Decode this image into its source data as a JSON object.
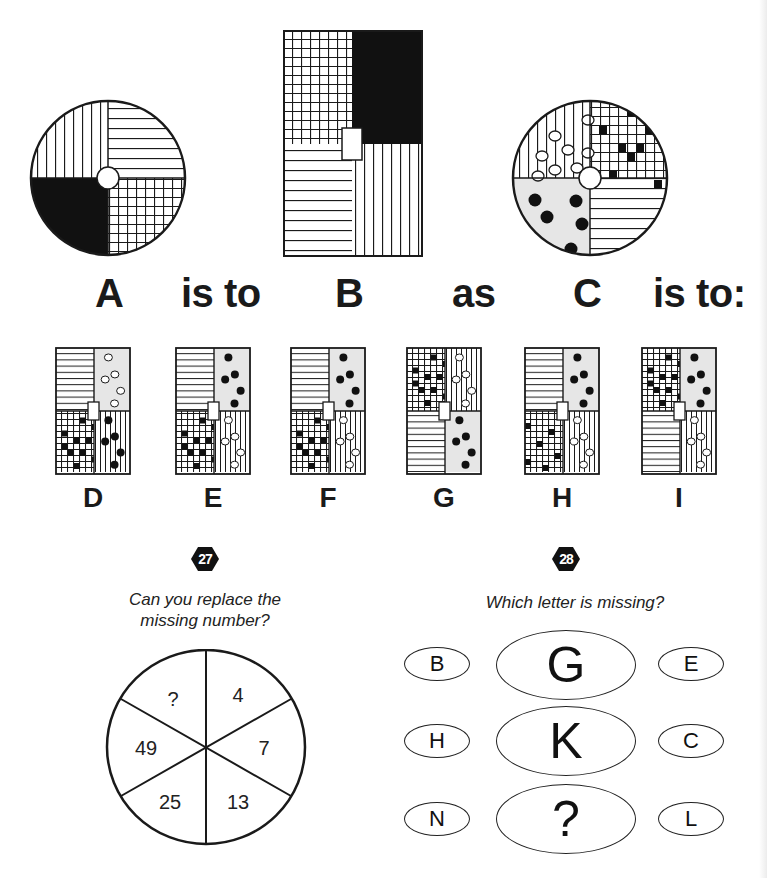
{
  "puzzle26": {
    "figures": {
      "A": {
        "label": "A",
        "shape": "circle",
        "quadrants": {
          "top_left": "vertical-lines",
          "top_right": "horizontal-lines",
          "bottom_left": "solid-black",
          "bottom_right": "grid"
        },
        "center": "white-circle"
      },
      "B": {
        "label": "B",
        "shape": "rectangle",
        "quadrants": {
          "top_left": "grid",
          "top_right": "solid-black",
          "bottom_left": "horizontal-lines",
          "bottom_right": "vertical-lines"
        },
        "center": "white-rectangle"
      },
      "C": {
        "label": "C",
        "shape": "circle",
        "quadrants": {
          "top_left": "vertical-lines-with-white-dots",
          "top_right": "grid-with-black-squares",
          "bottom_left": "grey-with-black-dots",
          "bottom_right": "horizontal-lines"
        },
        "center": "white-circle"
      }
    },
    "sentence": {
      "word1": "is to",
      "word2": "as",
      "word3": "is to:"
    },
    "options": [
      {
        "label": "D",
        "tl": "horizontal-lines",
        "tr": "grey-with-white-dots",
        "bl": "grid-with-black-squares",
        "br": "vertical-lines-with-black-dots"
      },
      {
        "label": "E",
        "tl": "horizontal-lines",
        "tr": "grey-with-black-dots",
        "bl": "grid-with-black-squares",
        "br": "vertical-lines-with-white-dots"
      },
      {
        "label": "F",
        "tl": "horizontal-lines",
        "tr": "grey-with-black-dots",
        "bl": "grid-with-black-squares",
        "br": "vertical-lines-with-white-dots"
      },
      {
        "label": "G",
        "tl": "grid-with-black-squares",
        "tr": "vertical-lines-with-white-dots",
        "bl": "horizontal-lines",
        "br": "grey-with-black-dots"
      },
      {
        "label": "H",
        "tl": "horizontal-lines",
        "tr": "grey-with-black-dots",
        "bl": "grid-with-scattered-squares",
        "br": "vertical-lines-with-white-dots"
      },
      {
        "label": "I",
        "tl": "grid-with-black-squares",
        "tr": "grey-with-black-dots",
        "bl": "horizontal-lines",
        "br": "vertical-lines-with-white-dots"
      }
    ]
  },
  "puzzle27": {
    "number": "27",
    "question_line1": "Can you replace the",
    "question_line2": "missing number?",
    "segments": [
      "?",
      "4",
      "7",
      "13",
      "25",
      "49"
    ]
  },
  "puzzle28": {
    "number": "28",
    "question": "Which letter is missing?",
    "rows": [
      {
        "left": "B",
        "center": "G",
        "right": "E"
      },
      {
        "left": "H",
        "center": "K",
        "right": "C"
      },
      {
        "left": "N",
        "center": "?",
        "right": "L"
      }
    ]
  },
  "colors": {
    "ink": "#1a1a1a",
    "grey_fill": "#e6e6e6",
    "badge": "#111111"
  }
}
